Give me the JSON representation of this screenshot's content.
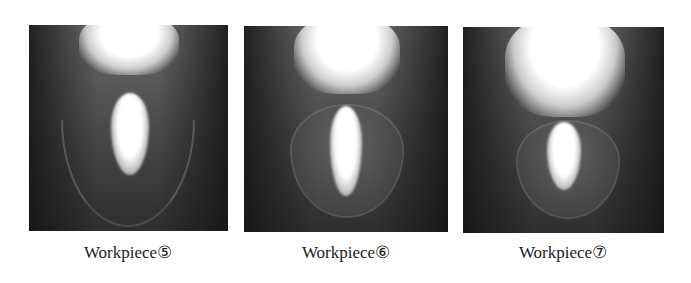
{
  "figure": {
    "panels": [
      {
        "id": "workpiece-5",
        "caption": "Workpiece⑤"
      },
      {
        "id": "workpiece-6",
        "caption": "Workpiece⑥"
      },
      {
        "id": "workpiece-7",
        "caption": "Workpiece⑦"
      }
    ]
  }
}
